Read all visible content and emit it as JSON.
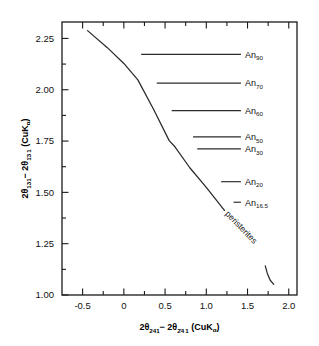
{
  "chart_data": {
    "type": "line",
    "title": "",
    "xlabel": "2θ₂₄₁ − 2θ₂̄₄₁ (CuKα)",
    "ylabel": "2θ₁₃₁ − 2θ₁̄₃₁ (CuKα)",
    "xlim": [
      -0.75,
      2.1
    ],
    "ylim": [
      1.0,
      2.33
    ],
    "grid": false,
    "legend_position": "inline-right",
    "xticks_major": [
      "-0.5",
      "0",
      "0.5",
      "1.0",
      "1.5",
      "2.0"
    ],
    "xticks_major_values": [
      -0.5,
      0,
      0.5,
      1.0,
      1.5,
      2.0
    ],
    "xticks_minor_values": [
      -0.25,
      0.25,
      0.75,
      1.25,
      1.75
    ],
    "yticks_major": [
      "1.00",
      "1.25",
      "1.50",
      "1.75",
      "2.00",
      "2.25"
    ],
    "yticks_major_values": [
      1.0,
      1.25,
      1.5,
      1.75,
      2.0,
      2.25
    ],
    "yticks_minor_values": [
      1.125,
      1.375,
      1.625,
      1.875,
      2.125
    ],
    "series": [
      {
        "name": "determinative-curve",
        "points": [
          [
            -0.44,
            2.288
          ],
          [
            -0.2,
            2.205
          ],
          [
            0.0,
            2.128
          ],
          [
            0.17,
            2.048
          ],
          [
            0.36,
            1.905
          ],
          [
            0.55,
            1.752
          ],
          [
            0.62,
            1.722
          ],
          [
            0.8,
            1.62
          ],
          [
            1.0,
            1.524
          ],
          [
            1.22,
            1.412
          ]
        ]
      },
      {
        "name": "peristerite-hook",
        "points": [
          [
            1.715,
            1.142
          ],
          [
            1.74,
            1.105
          ],
          [
            1.775,
            1.072
          ],
          [
            1.818,
            1.052
          ]
        ]
      }
    ],
    "tie_lines": [
      {
        "label": "An",
        "sub": "90",
        "y": 2.172,
        "x_start": 0.21,
        "x_end": 1.42
      },
      {
        "label": "An",
        "sub": "70",
        "y": 2.032,
        "x_start": 0.4,
        "x_end": 1.42
      },
      {
        "label": "An",
        "sub": "60",
        "y": 1.898,
        "x_start": 0.58,
        "x_end": 1.42
      },
      {
        "label": "An",
        "sub": "50",
        "y": 1.77,
        "x_start": 0.84,
        "x_end": 1.42
      },
      {
        "label": "An",
        "sub": "30",
        "y": 1.712,
        "x_start": 0.89,
        "x_end": 1.42
      },
      {
        "label": "An",
        "sub": "20",
        "y": 1.552,
        "x_start": 1.18,
        "x_end": 1.42
      },
      {
        "label": "An",
        "sub": "16.5",
        "y": 1.452,
        "x_start": 1.33,
        "x_end": 1.42
      }
    ],
    "annotations": [
      {
        "text": "peristerites",
        "x": 1.4,
        "y": 1.32,
        "rotation": 46
      }
    ]
  }
}
